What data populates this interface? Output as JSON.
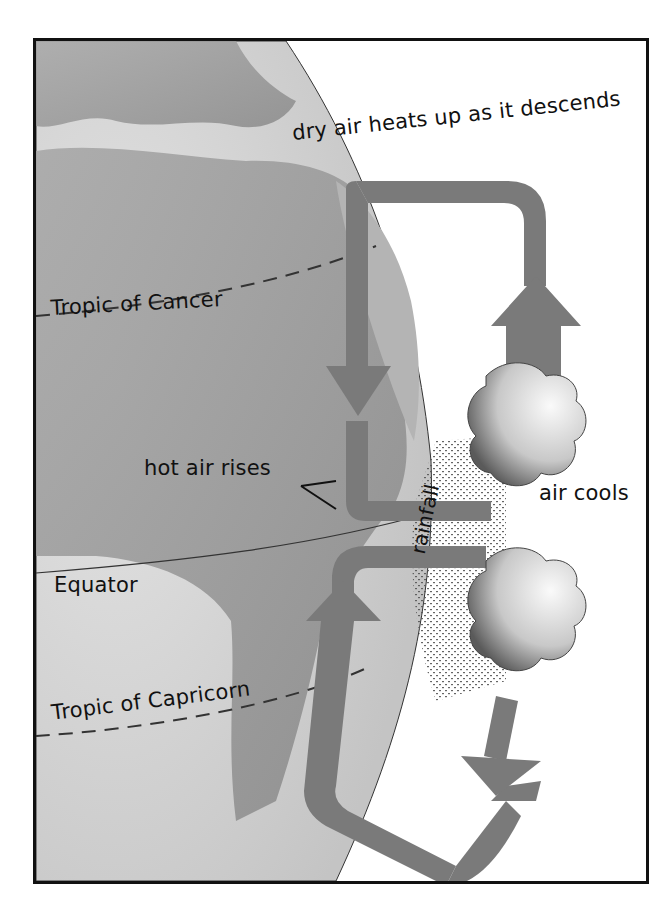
{
  "diagram": {
    "labels": {
      "descend": "dry air heats up as it descends",
      "tropic_cancer": "Tropic of Cancer",
      "hot_air": "hot air rises",
      "air_cools": "air cools",
      "rainfall": "rainfall",
      "equator": "Equator",
      "tropic_capricorn": "Tropic of Capricorn"
    },
    "colors": {
      "frame": "#111111",
      "globe_light": "#d9d9d9",
      "land": "#9a9a9a",
      "arrow": "#7a7a7a",
      "cloud": "#e6e6e6",
      "text": "#111111"
    }
  }
}
